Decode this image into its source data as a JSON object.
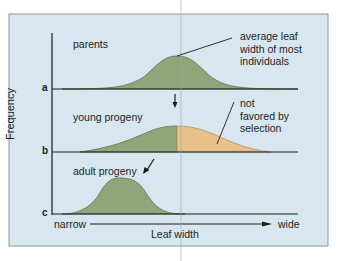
{
  "figure": {
    "y_axis_label": "Frequency",
    "x_axis_label": "Leaf width",
    "x_axis_low": "narrow",
    "x_axis_high": "wide",
    "colors": {
      "background": "#d8e7ef",
      "frame": "#8a9aa2",
      "favored_fill": "#8fa67a",
      "unfavored_fill": "#e8c089",
      "axis": "#1a1a1a"
    },
    "panels": [
      {
        "id": "a",
        "label": "parents"
      },
      {
        "id": "b",
        "label": "young progeny"
      },
      {
        "id": "c",
        "label": "adult progeny"
      }
    ],
    "annotations": {
      "average": [
        "average leaf",
        "width of most",
        "individuals"
      ],
      "not_favored": [
        "not",
        "favored by",
        "selection"
      ]
    }
  }
}
